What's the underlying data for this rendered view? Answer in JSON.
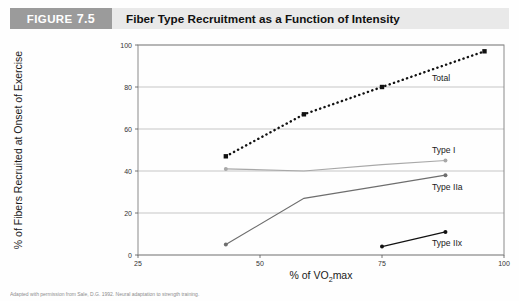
{
  "header": {
    "figure_word": "FIGURE",
    "figure_number": "7.5",
    "title": "Fiber Type Recruitment as a Function of Intensity",
    "tag_bg": "#9b9b9b",
    "title_bg": "#e9e9e9"
  },
  "caption": "Adapted with permission from Sale, D.G. 1992. Neural adaptation to strength training.",
  "chart_data": {
    "type": "line",
    "title": "Fiber Type Recruitment as a Function of Intensity",
    "xlabel": "% of VO2max",
    "xlabel_parts": {
      "pre": "% of VO",
      "sub": "2",
      "post": "max"
    },
    "ylabel": "% of Fibers Recruited at Onset of Exercise",
    "xlim": [
      25,
      100
    ],
    "ylim": [
      0,
      100
    ],
    "xticks": [
      25,
      50,
      75,
      100
    ],
    "xtick_labels": [
      "25",
      "50",
      "75",
      "100"
    ],
    "yticks": [
      0,
      20,
      40,
      60,
      80,
      100
    ],
    "ytick_labels": [
      "0",
      "20",
      "40",
      "60",
      "80",
      "100"
    ],
    "grid": "horizontal",
    "legend": "inline-right",
    "series": [
      {
        "name": "Total",
        "label": "Total",
        "color": "#111111",
        "style": "dotted",
        "marker": "square",
        "x": [
          43,
          59,
          75,
          96
        ],
        "y": [
          47,
          67,
          80,
          97
        ]
      },
      {
        "name": "Type I",
        "label": "Type I",
        "color": "#a8a8a8",
        "style": "solid",
        "marker": "dot",
        "x": [
          43,
          59,
          75,
          88
        ],
        "y": [
          41,
          40,
          43,
          45
        ]
      },
      {
        "name": "Type IIa",
        "label": "Type IIa",
        "color": "#6e6e6e",
        "style": "solid",
        "marker": "dot",
        "x": [
          43,
          59,
          75,
          88
        ],
        "y": [
          5,
          27,
          33,
          38
        ]
      },
      {
        "name": "Type IIx",
        "label": "Type IIx",
        "color": "#111111",
        "style": "solid",
        "marker": "dot",
        "x": [
          75,
          88
        ],
        "y": [
          4,
          11
        ]
      }
    ]
  }
}
